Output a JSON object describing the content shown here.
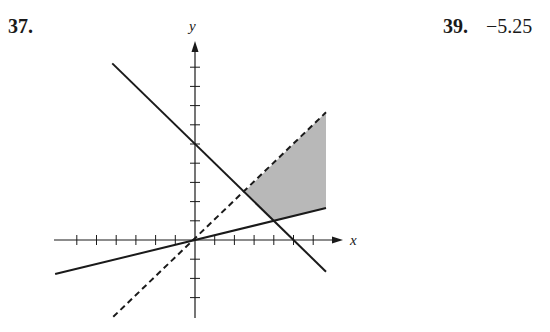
{
  "problems": [
    {
      "number": "37.",
      "answer": ""
    },
    {
      "number": "39.",
      "answer": "−5.25"
    }
  ],
  "colors": {
    "ink": "#1a1a1a",
    "shade": "#b8b8b8"
  },
  "chart_data": {
    "type": "line",
    "title": "",
    "xlabel": "x",
    "ylabel": "y",
    "xlim": [
      -7,
      7.5
    ],
    "ylim": [
      -4,
      10
    ],
    "x_ticks": [
      -6,
      -5,
      -4,
      -3,
      -2,
      -1,
      1,
      2,
      3,
      4,
      5,
      6
    ],
    "y_ticks": [
      -3,
      -2,
      -1,
      1,
      2,
      3,
      4,
      5,
      6,
      7,
      8,
      9
    ],
    "tick_labels_shown": false,
    "grid": false,
    "series": [
      {
        "name": "x + y = 5",
        "style": "solid",
        "points": [
          [
            -4.2,
            9.2
          ],
          [
            6.65,
            -1.65
          ]
        ]
      },
      {
        "name": "y = x",
        "style": "dashed",
        "points": [
          [
            -4.15,
            -4.0
          ],
          [
            6.65,
            6.65
          ]
        ]
      },
      {
        "name": "y = x/4",
        "style": "solid",
        "points": [
          [
            -7.1,
            -1.775
          ],
          [
            6.65,
            1.6625
          ]
        ]
      }
    ],
    "shaded_region": {
      "description": "feasible region: y < x, y >= x/4, x + y >= 5, bounded right at x = 6.65",
      "vertices": [
        [
          2.5,
          2.5
        ],
        [
          6.65,
          6.65
        ],
        [
          6.65,
          1.6625
        ],
        [
          4,
          1
        ],
        [
          2.5,
          2.5
        ]
      ]
    },
    "intersections": [
      {
        "lines": [
          "x + y = 5",
          "y = x"
        ],
        "point": [
          2.5,
          2.5
        ]
      },
      {
        "lines": [
          "x + y = 5",
          "y = x/4"
        ],
        "point": [
          4,
          1
        ]
      }
    ]
  },
  "layout": {
    "origin_px": [
      195,
      240
    ],
    "unit_x_px": 19.7,
    "unit_y_px": 19.2,
    "x_axis_px": [
      54,
      343
    ],
    "y_axis_px": [
      318,
      41
    ]
  }
}
